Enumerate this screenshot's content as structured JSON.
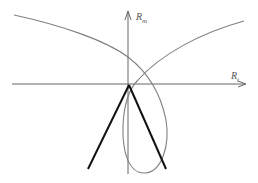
{
  "diagram": {
    "type": "phase-plane",
    "axes": {
      "vertical": {
        "label": "R",
        "subscript": "m"
      },
      "horizontal": {
        "label": "R",
        "subscript": "t"
      }
    },
    "colors": {
      "axis": "#555555",
      "curve": "#808080",
      "bold_lines": "#111111",
      "background": "#ffffff"
    },
    "elements": [
      {
        "name": "curve-left-branch",
        "description": "Curve descending from upper-left, crossing vertical axis, forming a loop below horizontal axis"
      },
      {
        "name": "curve-right-branch",
        "description": "Curve rising from loop to upper-right"
      },
      {
        "name": "bold-v-lines",
        "description": "Two bold straight lines forming an inverted V with apex at origin"
      }
    ]
  }
}
